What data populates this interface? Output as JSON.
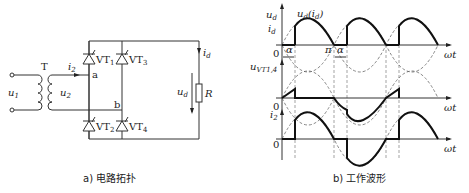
{
  "circuit": {
    "transformer_label": "T",
    "primary_voltage": "u",
    "primary_voltage_sub": "1",
    "secondary_voltage": "u",
    "secondary_voltage_sub": "2",
    "secondary_current": "i",
    "secondary_current_sub": "2",
    "node_a": "a",
    "node_b": "b",
    "thyristors": [
      {
        "name": "VT",
        "sub": "1"
      },
      {
        "name": "VT",
        "sub": "3"
      },
      {
        "name": "VT",
        "sub": "2"
      },
      {
        "name": "VT",
        "sub": "4"
      }
    ],
    "load_current": "i",
    "load_current_sub": "d",
    "load_voltage": "u",
    "load_voltage_sub": "d",
    "resistor": "R",
    "caption": "a) 电路拓扑"
  },
  "waveforms": {
    "plot1": {
      "y_label_1": "u",
      "y_label_1_sub": "d",
      "y_label_2": "i",
      "y_label_2_sub": "d",
      "curve_label": "u",
      "curve_label_sub": "d",
      "curve_label_paren": "(i",
      "curve_label_paren_sub": "d",
      "curve_label_close": ")",
      "origin": "0",
      "alpha_1": "α",
      "pi": "π",
      "alpha_2": "α",
      "x_label": "ωt"
    },
    "plot2": {
      "y_label": "u",
      "y_label_sub": "VT1,4",
      "origin": "0",
      "x_label": "ωt"
    },
    "plot3": {
      "y_label": "i",
      "y_label_sub": "2",
      "origin": "0",
      "x_label": "ωt"
    },
    "caption": "b) 工作波形"
  }
}
